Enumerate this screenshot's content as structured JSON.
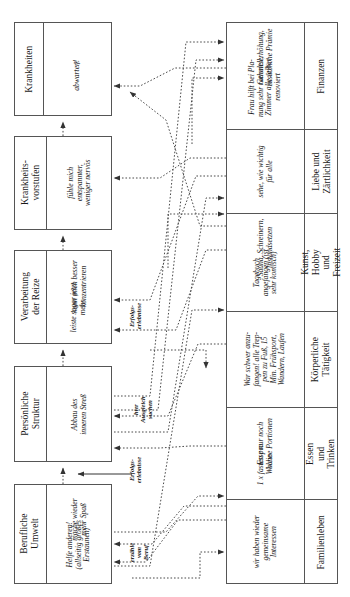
{
  "diagram": {
    "orientation": "rotated-90",
    "left_column": [
      {
        "id": "krankheiten",
        "header": "Krankheiten",
        "entries": [
          "?",
          "abwarten!"
        ]
      },
      {
        "id": "krankheitsvorstufen",
        "header": "Krankheits-\nvorstufen",
        "entries": [
          "fühle mich\nentspannter,\nweniger nervös"
        ]
      },
      {
        "id": "verarbeitung",
        "header": "Verarbeitung\nder Reize",
        "entries": [
          "kann mich besser\nkonzentrieren",
          "leiste sogar jetzt\nmehr"
        ]
      },
      {
        "id": "persoenliche-struktur",
        "header": "Persönliche\nStruktur",
        "entries": [
          "Abbau des\ninneren Streß"
        ]
      },
      {
        "id": "berufliche-umwelt",
        "header": "Berufliche\nUmwelt",
        "entries": [
          "mache wieder\nmehr Spaß",
          "Helfe anderen!\n(allseitig großes\nErstaunen)"
        ]
      }
    ],
    "right_column": [
      {
        "id": "finanzen",
        "label": "Finanzen",
        "entries": [
          "Gehaltserhöhung,\nzusätzliche Prämie",
          "Frau hilft bei Pla-\nnung sehr rationell,\nZimmer alle selber\nrenoviert"
        ]
      },
      {
        "id": "liebe-zaertlichkeit",
        "label": "Liebe und\nZärtlichkeit",
        "entries": [
          "sehe, wie wichtig\nfür alle"
        ]
      },
      {
        "id": "kunst-hobby-freizeit",
        "label": "Kunst, Hobby\nund Freizeit",
        "entries": [
          "Sauna, Schreinern,\nInstandsetzen",
          "Tagebuch\nangefangen (ist\nsehr komisch)"
        ]
      },
      {
        "id": "koerperliche-taetigkeit",
        "label": "Körperliche\nTätigkeit",
        "entries": [
          "War schwer anzu-\nfangen! alle Trep-\npen zu Fuß, 15\nMin. Frühsport,\nWandern, Laufen"
        ]
      },
      {
        "id": "essen-trinken",
        "label": "Essen und\nTrinken",
        "entries": [
          "Esse nur noch\nkleine Portionen",
          "1 x fasten pro\nWoche"
        ]
      },
      {
        "id": "familienleben",
        "label": "Familienleben",
        "entries": [
          "wir haben wieder\ngemeinsame\nInteressen"
        ]
      }
    ],
    "connector_labels": [
      {
        "id": "erfolgserlebnisse-top",
        "text": "Erfolgs-\nerlebnisse"
      },
      {
        "id": "hier-ausgleich-suchen",
        "text": "hier Ausgleich\nsuchen"
      },
      {
        "id": "erfolgserlebnisse-bottom",
        "text": "Erfolgs-\nerlebnisse"
      },
      {
        "id": "erzaehle-vom-beruf",
        "text": "erzähle\nvom\nBeruf"
      }
    ],
    "colors": {
      "border": "#555555",
      "text": "#1a1a1a",
      "connector": "#4a4a4a",
      "background": "#ffffff"
    }
  }
}
